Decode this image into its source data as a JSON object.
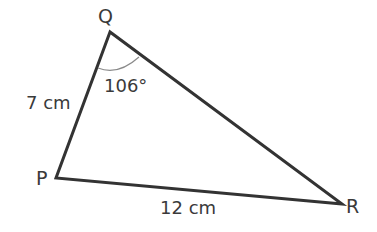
{
  "diagram": {
    "vertices": {
      "P": {
        "label": "P",
        "x": 56,
        "y": 178
      },
      "Q": {
        "label": "Q",
        "x": 110,
        "y": 32
      },
      "R": {
        "label": "R",
        "x": 342,
        "y": 204
      }
    },
    "sides": {
      "PQ": {
        "label": "7 cm"
      },
      "PR": {
        "label": "12 cm"
      }
    },
    "angle_Q": {
      "label": "106°"
    },
    "colors": {
      "line": "#333333",
      "arc": "#888888",
      "text": "#3a3a3a"
    }
  }
}
